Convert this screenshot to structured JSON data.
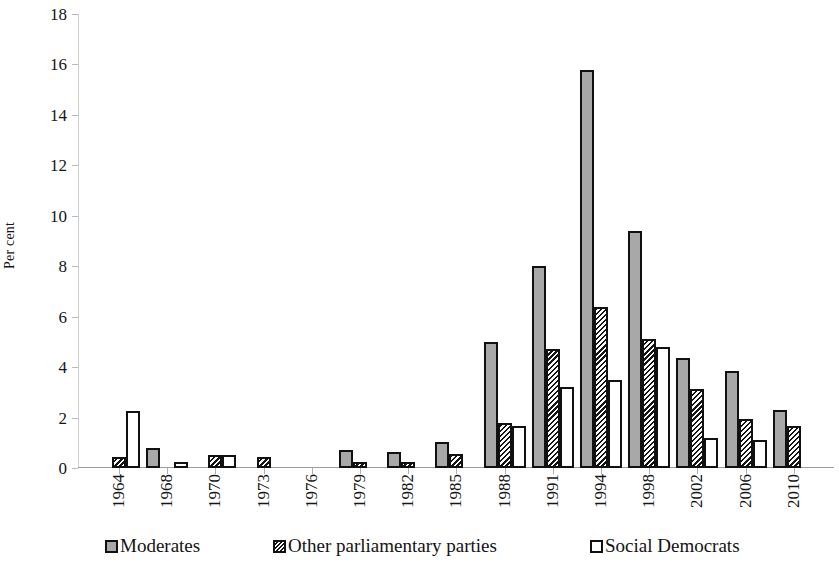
{
  "chart_data": {
    "type": "bar",
    "title": "",
    "subtitle": "",
    "xlabel": "",
    "ylabel": "Per cent",
    "ylim": [
      0,
      18
    ],
    "ytick_step": 2,
    "yticks": [
      "0",
      "2",
      "4",
      "6",
      "8",
      "10",
      "12",
      "14",
      "16",
      "18"
    ],
    "grid": false,
    "legend_position": "bottom",
    "categories": [
      "1964",
      "1968",
      "1970",
      "1973",
      "1976",
      "1979",
      "1982",
      "1985",
      "1988",
      "1991",
      "1994",
      "1998",
      "2002",
      "2006",
      "2010"
    ],
    "series": [
      {
        "name": "Moderates",
        "color": "#a8a8a8",
        "pattern": "solid-gray",
        "values": [
          0,
          0.8,
          0,
          0,
          0,
          0.7,
          0.65,
          1.05,
          5.0,
          8.0,
          15.8,
          9.4,
          4.35,
          3.85,
          2.3
        ]
      },
      {
        "name": "Other parliamentary parties",
        "color": "#ffffff",
        "pattern": "diagonal-hatch",
        "values": [
          0.45,
          0,
          0.5,
          0.45,
          0,
          0.25,
          0.25,
          0.55,
          1.8,
          4.7,
          6.4,
          5.1,
          3.15,
          1.95,
          1.65
        ]
      },
      {
        "name": "Social Democrats",
        "color": "#ffffff",
        "pattern": "open",
        "values": [
          2.25,
          0.25,
          0.5,
          0,
          0,
          0,
          0,
          0,
          1.65,
          3.2,
          3.5,
          4.8,
          1.2,
          1.1,
          0
        ]
      }
    ]
  }
}
